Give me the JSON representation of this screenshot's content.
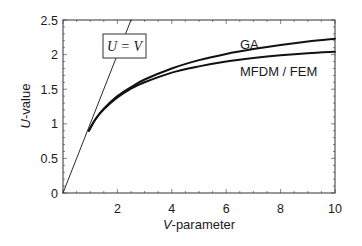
{
  "chart_data": {
    "type": "line",
    "title": "",
    "xlabel": "V-parameter",
    "xlabel_italic_part": "V",
    "xlabel_rest": "-parameter",
    "ylabel": "U-value",
    "ylabel_italic_part": "U",
    "ylabel_rest": "-value",
    "xlim": [
      0,
      10
    ],
    "ylim": [
      0,
      2.5
    ],
    "xticks": [
      2,
      4,
      6,
      8,
      10
    ],
    "xtick_labels": [
      "2",
      "4",
      "6",
      "8",
      "10"
    ],
    "yticks": [
      0,
      0.5,
      1,
      1.5,
      2,
      2.5
    ],
    "ytick_labels": [
      "0",
      "0.5",
      "1",
      "1.5",
      "2",
      "2.5"
    ],
    "grid": false,
    "legend": "inline labels",
    "series": [
      {
        "name": "U = V",
        "style": "thin",
        "x": [
          0,
          2.5
        ],
        "y": [
          0,
          2.5
        ]
      },
      {
        "name": "GA",
        "style": "thick",
        "x": [
          0.95,
          1.2,
          1.5,
          2,
          2.5,
          3,
          4,
          5,
          6,
          7,
          8,
          9,
          10
        ],
        "y": [
          0.9,
          1.07,
          1.22,
          1.4,
          1.53,
          1.64,
          1.8,
          1.92,
          2.01,
          2.08,
          2.14,
          2.19,
          2.23
        ]
      },
      {
        "name": "MFDM / FEM",
        "style": "thick",
        "x": [
          0.95,
          1.2,
          1.5,
          2,
          2.5,
          3,
          4,
          5,
          6,
          7,
          8,
          9,
          10
        ],
        "y": [
          0.9,
          1.07,
          1.21,
          1.38,
          1.51,
          1.6,
          1.74,
          1.83,
          1.9,
          1.95,
          1.99,
          2.02,
          2.04
        ]
      }
    ],
    "annotations": [
      {
        "text": "U = V",
        "boxed": true,
        "x": 1.5,
        "y": 2.1
      },
      {
        "text": "GA",
        "x": 6.8,
        "y": 2.18
      },
      {
        "text": "MFDM / FEM",
        "x": 7.7,
        "y": 1.7
      }
    ]
  }
}
